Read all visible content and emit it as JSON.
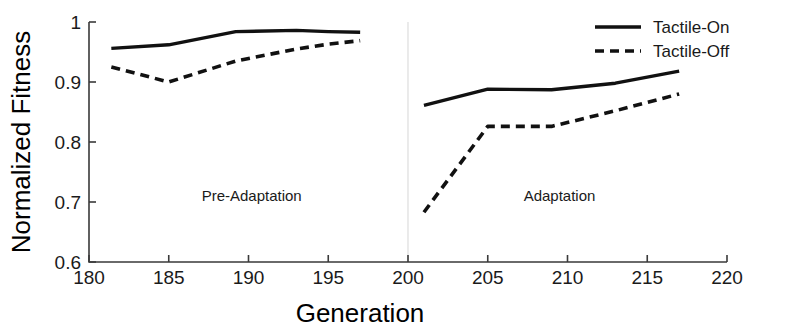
{
  "chart_data": {
    "type": "line",
    "title": "",
    "xlabel": "Generation",
    "ylabel": "Normalized Fitness",
    "xlim": [
      180,
      220
    ],
    "ylim": [
      0.6,
      1.0
    ],
    "xticks": [
      180,
      185,
      190,
      195,
      200,
      205,
      210,
      215,
      220
    ],
    "xtick_labels": [
      "180",
      "185",
      "190",
      "195",
      "200",
      "205",
      "210",
      "215",
      "220"
    ],
    "yticks": [
      0.6,
      0.7,
      0.8,
      0.9,
      1.0
    ],
    "ytick_labels": [
      "0.6",
      "0.7",
      "0.8",
      "0.9",
      "1"
    ],
    "grid": false,
    "legend_position": "top-right",
    "series": [
      {
        "name": "Tactile-On",
        "style": "solid",
        "color": "#111111",
        "segments": [
          {
            "phase": "Pre-Adaptation",
            "x": [
              181.4,
              185.0,
              189.2,
              193.0,
              195.0,
              197.0
            ],
            "values": [
              0.956,
              0.962,
              0.984,
              0.986,
              0.984,
              0.983
            ]
          },
          {
            "phase": "Adaptation",
            "x": [
              201.0,
              205.0,
              209.0,
              213.0,
              217.0
            ],
            "values": [
              0.861,
              0.888,
              0.887,
              0.898,
              0.918
            ]
          }
        ]
      },
      {
        "name": "Tactile-Off",
        "style": "dashed",
        "color": "#111111",
        "segments": [
          {
            "phase": "Pre-Adaptation",
            "x": [
              181.4,
              185.0,
              189.2,
              193.0,
              195.0,
              197.0
            ],
            "values": [
              0.925,
              0.9,
              0.935,
              0.955,
              0.963,
              0.969
            ]
          },
          {
            "phase": "Adaptation",
            "x": [
              201.0,
              205.0,
              209.0,
              213.0,
              217.0
            ],
            "values": [
              0.683,
              0.826,
              0.826,
              0.852,
              0.88
            ]
          }
        ]
      }
    ],
    "annotations": [
      {
        "text": "Pre-Adaptation",
        "x": 190.2,
        "y": 0.702
      },
      {
        "text": "Adaptation",
        "x": 209.5,
        "y": 0.702
      }
    ],
    "separator_x": 200
  },
  "legend": {
    "items": [
      {
        "label": "Tactile-On",
        "style": "solid"
      },
      {
        "label": "Tactile-Off",
        "style": "dashed"
      }
    ]
  },
  "axes": {
    "x_title": "Generation",
    "y_title": "Normalized Fitness"
  }
}
